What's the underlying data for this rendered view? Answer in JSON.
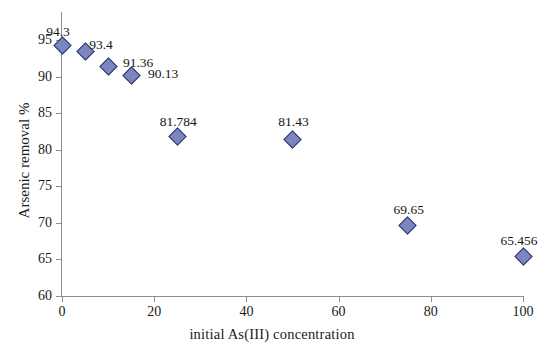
{
  "chart_data": {
    "type": "scatter",
    "title": "",
    "xlabel": "initial  As(III) concentration",
    "ylabel": "Arsenic removal %",
    "xlim": [
      0,
      100
    ],
    "ylim": [
      60,
      95
    ],
    "grid": false,
    "legend": false,
    "marker_shape": "diamond",
    "marker_fill": "#7b86c1",
    "marker_edge": "#2e3a6b",
    "axis_color": "#8e8e8e",
    "xticks": [
      "0",
      "20",
      "40",
      "60",
      "80",
      "100"
    ],
    "xtick_values": [
      0,
      20,
      40,
      60,
      80,
      100
    ],
    "yticks": [
      "60",
      "65",
      "70",
      "75",
      "80",
      "85",
      "90",
      "95"
    ],
    "ytick_values": [
      60,
      65,
      70,
      75,
      80,
      85,
      90,
      95
    ],
    "series": [
      {
        "name": "Arsenic removal",
        "x": [
          0,
          5,
          10,
          15,
          25,
          50,
          75,
          100
        ],
        "y": [
          94.3,
          93.4,
          91.36,
          90.13,
          81.784,
          81.43,
          69.65,
          65.456
        ],
        "labels": [
          "94.3",
          "93.4",
          "91.36",
          "90.13",
          "81.784",
          "81.43",
          "69.65",
          "65.456"
        ]
      }
    ],
    "points": [
      {
        "x": 0,
        "y": 94.3,
        "label": "94.3",
        "label_dx": -4,
        "label_dy": -20
      },
      {
        "x": 5,
        "y": 93.4,
        "label": "93.4",
        "label_dx": 16,
        "label_dy": -14
      },
      {
        "x": 10,
        "y": 91.36,
        "label": "91.36",
        "label_dx": 30,
        "label_dy": -11
      },
      {
        "x": 15,
        "y": 90.13,
        "label": "90.13",
        "label_dx": 32,
        "label_dy": -9
      },
      {
        "x": 25,
        "y": 81.784,
        "label": "81.784",
        "label_dx": 1,
        "label_dy": -22
      },
      {
        "x": 50,
        "y": 81.43,
        "label": "81.43",
        "label_dx": 1,
        "label_dy": -24
      },
      {
        "x": 75,
        "y": 69.65,
        "label": "69.65",
        "label_dx": 1,
        "label_dy": -22
      },
      {
        "x": 100,
        "y": 65.456,
        "label": "65.456",
        "label_dx": -4,
        "label_dy": -22
      }
    ]
  }
}
